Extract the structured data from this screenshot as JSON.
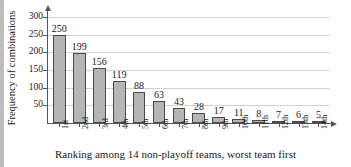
{
  "chart_data": {
    "type": "bar",
    "title": "",
    "xlabel": "Ranking among 14 non-playoff teams, worst team first",
    "ylabel": "Frequency of combinations",
    "categories": [
      "1st",
      "2nd",
      "3rd",
      "4th",
      "5th",
      "6th",
      "7th",
      "8th",
      "9th",
      "10th",
      "11th",
      "12th",
      "13th",
      "14th"
    ],
    "values": [
      250,
      199,
      156,
      119,
      88,
      63,
      43,
      28,
      17,
      11,
      8,
      7,
      6,
      5
    ],
    "ylim": [
      0,
      320
    ],
    "yticks": [
      50,
      100,
      150,
      200,
      250,
      300
    ],
    "ytick_labels": [
      "50",
      "100",
      "150",
      "200",
      "250",
      "300"
    ],
    "grid": true,
    "grid_axis": "y",
    "legend": false,
    "bar_color": "#b5b5b5",
    "bar_edge_color": "#4a4a4a",
    "axis_color": "#555555",
    "grid_color": "#d2d2d2",
    "text_color": "#1a1a1a",
    "value_labels": [
      "250",
      "199",
      "156",
      "119",
      "88",
      "63",
      "43",
      "28",
      "17",
      "11",
      "8",
      "7",
      "6",
      "5"
    ]
  }
}
